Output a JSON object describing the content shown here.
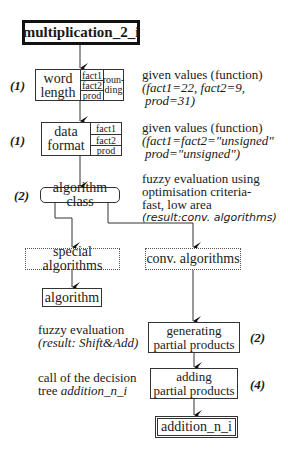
{
  "diagram": {
    "title": "multiplication_2_i",
    "word_length": {
      "label_line1": "word",
      "label_line2": "length",
      "fields": [
        "fact1",
        "fact2",
        "prod"
      ],
      "extra_line1": "roun-",
      "extra_line2": "ding",
      "step_label": "(1)",
      "note_line1": "given values (function)",
      "note_line2": "(fact1=22, fact2=9,",
      "note_line3": "prod=31)"
    },
    "data_format": {
      "label_line1": "data",
      "label_line2": "format",
      "fields": [
        "fact1",
        "fact2",
        "prod"
      ],
      "step_label": "(1)",
      "note_line1": "given values (function)",
      "note_line2": "(fact1=fact2=\"unsigned\"",
      "note_line3": "prod=\"unsigned\")"
    },
    "algorithm_class": {
      "label": "algorithm class",
      "step_label": "(2)",
      "note_line1": "fuzzy evaluation using",
      "note_line2": "optimisation criteria-",
      "note_line3": "fast, low area",
      "note_line4": "(result:conv. algorithms)"
    },
    "special_algorithms": {
      "label": "special algorithms"
    },
    "conv_algorithms": {
      "label": "conv. algorithms"
    },
    "algorithm": {
      "label": "algorithm"
    },
    "generating": {
      "label_line1": "generating",
      "label_line2": "partial products",
      "step_label": "(2)",
      "note_line1": "fuzzy evaluation",
      "note_line2": "(result: Shift&Add)"
    },
    "adding": {
      "label_line1": "adding",
      "label_line2": "partial products",
      "step_label": "(4)",
      "note_line1": "call of the decision",
      "note_line2_prefix": "tree ",
      "note_line2_italic": "addition_n_i"
    },
    "addition": {
      "label": "addition_n_i"
    }
  }
}
